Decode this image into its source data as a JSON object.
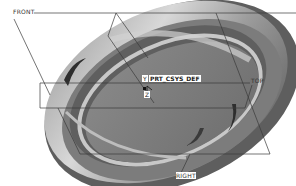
{
  "viewport": {
    "background": "#ffffff",
    "model": {
      "type": "shaded-disk",
      "colors": {
        "rim_dark": "#4a4a4a",
        "face": "#7d7d7d",
        "light": "#c9c9c9",
        "highlight": "#e4e4e4"
      }
    },
    "datum_planes": [
      {
        "name": "FRONT",
        "label": "FRONT"
      },
      {
        "name": "TOP",
        "label": "TOP"
      },
      {
        "name": "RIGHT",
        "label": "RIGHT"
      }
    ],
    "csys": {
      "label": "PRT_CSYS_DEF",
      "axis_y": "Y",
      "axis_z": "Z"
    },
    "line_color": "#3a3a3a"
  }
}
